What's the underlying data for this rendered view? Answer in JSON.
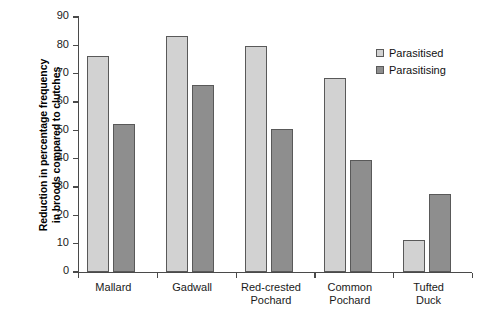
{
  "chart_data": {
    "type": "bar",
    "title": "",
    "xlabel": "",
    "ylabel": "Reduction in percentage frequency in broods compared to clutches",
    "ylabel_lines": [
      "Reduction in percentage frequency",
      "in broods compared to clutches"
    ],
    "categories": [
      "Mallard",
      "Gadwall",
      "Red-crested Pochard",
      "Common Pochard",
      "Tufted Duck"
    ],
    "category_label_lines": [
      [
        "Mallard"
      ],
      [
        "Gadwall"
      ],
      [
        "Red-crested",
        "Pochard"
      ],
      [
        "Common",
        "Pochard"
      ],
      [
        "Tufted Duck"
      ]
    ],
    "series": [
      {
        "name": "Parasitised",
        "color": "#d2d2d2",
        "values": [
          76.4,
          83.2,
          79.6,
          68.3,
          11.2
        ]
      },
      {
        "name": "Parasitising",
        "color": "#8e8e8e",
        "values": [
          52.4,
          66.0,
          50.6,
          39.6,
          27.4
        ]
      }
    ],
    "ylim": [
      0,
      90
    ],
    "yticks": [
      0,
      10,
      20,
      30,
      40,
      50,
      60,
      70,
      80,
      90
    ],
    "ytick_labels": [
      "0",
      "10",
      "20",
      "30",
      "40",
      "50",
      "60",
      "70",
      "80",
      "90"
    ],
    "grid": false,
    "legend_position": "top-right"
  },
  "legend": {
    "entries": [
      {
        "label": "Parasitised"
      },
      {
        "label": "Parasitising"
      }
    ]
  },
  "axis": {
    "y_title_line1": "Reduction in percentage frequency",
    "y_title_line2": "in broods compared to clutches"
  }
}
